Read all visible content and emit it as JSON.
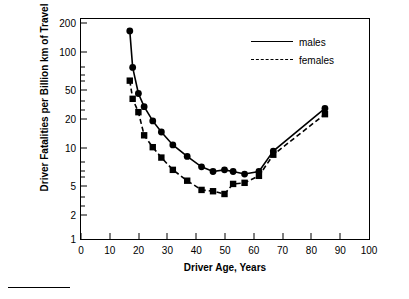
{
  "chart_data": {
    "type": "line",
    "title": "",
    "xlabel": "Driver Age, Years",
    "ylabel": "Driver Fatalities per Billion km of Travel",
    "xlim": [
      0,
      100
    ],
    "ylim": [
      1,
      200
    ],
    "yscale": "log",
    "grid": false,
    "legend_position": "top-right",
    "x_ticks": [
      "0",
      "10",
      "20",
      "30",
      "40",
      "50",
      "60",
      "70",
      "80",
      "90",
      "100"
    ],
    "y_ticks": [
      "1",
      "2",
      "5",
      "10",
      "20",
      "50",
      "100",
      "200"
    ],
    "series": [
      {
        "name": "males",
        "marker": "circle",
        "line": "solid",
        "points": [
          {
            "x": 17,
            "y": 150
          },
          {
            "x": 18,
            "y": 62
          },
          {
            "x": 20,
            "y": 33
          },
          {
            "x": 22,
            "y": 24
          },
          {
            "x": 25,
            "y": 17
          },
          {
            "x": 28,
            "y": 13
          },
          {
            "x": 32,
            "y": 9.5
          },
          {
            "x": 37,
            "y": 7.2
          },
          {
            "x": 42,
            "y": 5.6
          },
          {
            "x": 46,
            "y": 5.0
          },
          {
            "x": 50,
            "y": 5.2
          },
          {
            "x": 53,
            "y": 5.0
          },
          {
            "x": 57,
            "y": 4.7
          },
          {
            "x": 62,
            "y": 5.0
          },
          {
            "x": 67,
            "y": 8.2
          },
          {
            "x": 85,
            "y": 23
          }
        ]
      },
      {
        "name": "females",
        "marker": "square",
        "line": "dashed",
        "points": [
          {
            "x": 17,
            "y": 45
          },
          {
            "x": 18,
            "y": 29
          },
          {
            "x": 20,
            "y": 21
          },
          {
            "x": 22,
            "y": 12
          },
          {
            "x": 25,
            "y": 9.0
          },
          {
            "x": 28,
            "y": 7.0
          },
          {
            "x": 32,
            "y": 5.2
          },
          {
            "x": 37,
            "y": 4.0
          },
          {
            "x": 42,
            "y": 3.2
          },
          {
            "x": 46,
            "y": 3.1
          },
          {
            "x": 50,
            "y": 2.9
          },
          {
            "x": 53,
            "y": 3.7
          },
          {
            "x": 57,
            "y": 3.8
          },
          {
            "x": 62,
            "y": 4.5
          },
          {
            "x": 67,
            "y": 7.5
          },
          {
            "x": 85,
            "y": 20
          }
        ]
      }
    ],
    "legend": [
      "males",
      "females"
    ]
  }
}
